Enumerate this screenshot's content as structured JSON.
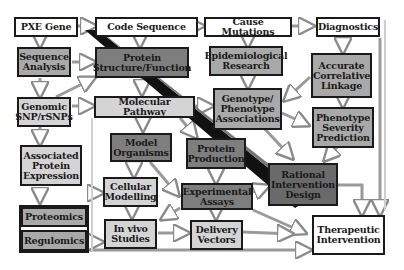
{
  "diagram": {
    "top_row": {
      "pxe_gene": "PXE Gene",
      "code_sequence": "Code Sequence",
      "cause_mutations": "Cause Mutations",
      "diagnostics": "Diagnostics"
    },
    "nodes": {
      "sequence_analysis": "Sequence\nAnalysis",
      "protein_structure": "Protein\nStructure/Function",
      "epidemiological_research": "Epidemiological\nResearch",
      "accurate_linkage": "Accurate\nCorrelative\nLinkage",
      "genomic_snp": "Genomic\nSNP/rSNPs",
      "molecular_pathway": "Molecular Pathway",
      "genotype_phenotype": "Genotype/\nPhenotype\nAssociations",
      "phenotype_severity": "Phenotype\nSeverity\nPrediction",
      "associated_protein": "Associated\nProtein\nExpression",
      "model_organisms": "Model\nOrganisms",
      "protein_production": "Protein\nProduction",
      "rational_intervention": "Rational\nIntervention\nDesign",
      "cellular_modelling": "Cellular\nModelling",
      "experimental_assays": "Experimental\nAssays",
      "proteomics": "Proteomics",
      "regulomics": "Regulomics",
      "in_vivo_studies": "In vivo\nStudies",
      "delivery_vectors": "Delivery\nVectors",
      "therapeutic_intervention": "Therapeutic\nIntervention"
    },
    "colors": {
      "white": "#ffffff",
      "light": "#d4d4d4",
      "mid": "#a9a9a9",
      "dark": "#7e7e7e",
      "border": "#1a1a1a",
      "diagonal_bar": "#111111"
    }
  }
}
